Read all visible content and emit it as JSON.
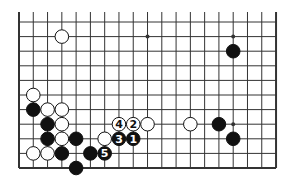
{
  "diagram": {
    "type": "go-board-fragment",
    "columns": 19,
    "rows": 11,
    "edges": {
      "top": false,
      "left": true,
      "right": true,
      "bottom": true
    },
    "origin_x": 19,
    "origin_y": 22,
    "spacing_x": 14.28,
    "spacing_y": 14.6,
    "stone_radius": 6.8,
    "colors": {
      "line": "#333333",
      "black": "#111111",
      "white": "#ffffff",
      "background": "#ffffff"
    },
    "star_points": [
      [
        9,
        1
      ],
      [
        15,
        1
      ],
      [
        15,
        7
      ]
    ],
    "stones": [
      {
        "color": "white",
        "col": 3,
        "row": 1
      },
      {
        "color": "black",
        "col": 15,
        "row": 2
      },
      {
        "color": "white",
        "col": 1,
        "row": 5
      },
      {
        "color": "black",
        "col": 1,
        "row": 6
      },
      {
        "color": "white",
        "col": 2,
        "row": 6
      },
      {
        "color": "white",
        "col": 3,
        "row": 6
      },
      {
        "color": "black",
        "col": 2,
        "row": 7
      },
      {
        "color": "white",
        "col": 3,
        "row": 7
      },
      {
        "color": "white",
        "col": 7,
        "row": 7,
        "label": "4"
      },
      {
        "color": "white",
        "col": 8,
        "row": 7,
        "label": "2"
      },
      {
        "color": "white",
        "col": 9,
        "row": 7
      },
      {
        "color": "white",
        "col": 12,
        "row": 7
      },
      {
        "color": "black",
        "col": 14,
        "row": 7
      },
      {
        "color": "black",
        "col": 2,
        "row": 8
      },
      {
        "color": "white",
        "col": 3,
        "row": 8
      },
      {
        "color": "black",
        "col": 4,
        "row": 8
      },
      {
        "color": "white",
        "col": 6,
        "row": 8
      },
      {
        "color": "black",
        "col": 7,
        "row": 8,
        "label": "3"
      },
      {
        "color": "black",
        "col": 8,
        "row": 8,
        "label": "1"
      },
      {
        "color": "black",
        "col": 15,
        "row": 8
      },
      {
        "color": "white",
        "col": 1,
        "row": 9
      },
      {
        "color": "white",
        "col": 2,
        "row": 9
      },
      {
        "color": "black",
        "col": 3,
        "row": 9
      },
      {
        "color": "black",
        "col": 5,
        "row": 9
      },
      {
        "color": "black",
        "col": 6,
        "row": 9,
        "label": "5"
      },
      {
        "color": "black",
        "col": 4,
        "row": 10
      }
    ]
  }
}
